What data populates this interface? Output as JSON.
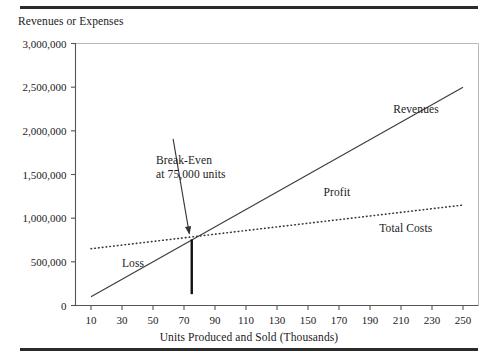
{
  "figure": {
    "top_rule": "",
    "bottom_rule": ""
  },
  "chart_data": {
    "type": "line",
    "title": "",
    "xlabel": "Units Produced and Sold (Thousands)",
    "ylabel": "Revenues or Expenses",
    "xlim": [
      0,
      260
    ],
    "ylim": [
      0,
      3000000
    ],
    "grid": false,
    "legend_position": "inline-labels",
    "xticks": [
      10,
      30,
      50,
      70,
      90,
      110,
      130,
      150,
      170,
      190,
      210,
      230,
      250
    ],
    "xtick_labels": [
      "10",
      "30",
      "50",
      "70",
      "90",
      "110",
      "130",
      "150",
      "170",
      "190",
      "210",
      "230",
      "250"
    ],
    "yticks": [
      0,
      500000,
      1000000,
      1500000,
      2000000,
      2500000,
      3000000
    ],
    "ytick_labels": [
      "0",
      "500,000",
      "1,000,000",
      "1,500,000",
      "2,000,000",
      "2,500,000",
      "3,000,000"
    ],
    "series": [
      {
        "name": "Revenues",
        "style": "solid",
        "label": "Revenues",
        "label_x": 205,
        "label_y": 2235000,
        "x": [
          10,
          250
        ],
        "values": [
          100000,
          2500000
        ]
      },
      {
        "name": "Total Costs",
        "style": "dotted",
        "label": "Total Costs",
        "label_x": 196,
        "label_y": 880000,
        "x": [
          10,
          250
        ],
        "values": [
          650000,
          1150000
        ]
      }
    ],
    "regions": [
      {
        "name": "Loss",
        "label": "Loss",
        "label_x": 30,
        "label_y": 480000
      },
      {
        "name": "Profit",
        "label": "Profit",
        "label_x": 160,
        "label_y": 1290000
      }
    ],
    "annotations": [
      {
        "name": "break-even",
        "line1": "Break-Even",
        "line2": "at 75,000 units",
        "text_x": 52,
        "text_y": 1610000,
        "point_x": 75,
        "point_y": 757000,
        "marker_bottom_y": 130000
      }
    ]
  }
}
